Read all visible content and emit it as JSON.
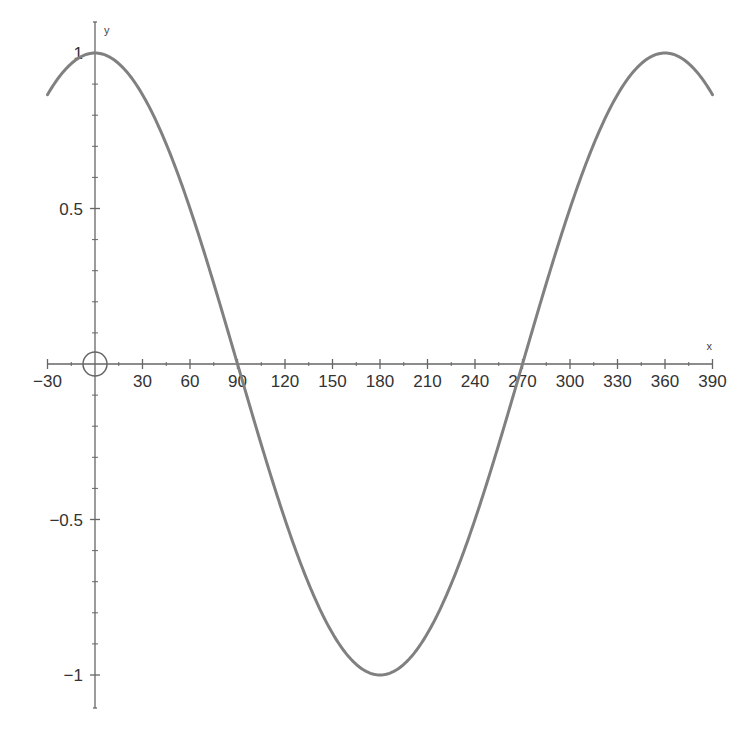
{
  "chart_data": {
    "type": "line",
    "title": "",
    "xlabel": "x",
    "ylabel": "y",
    "xlim": [
      -30,
      390
    ],
    "ylim": [
      -1,
      1
    ],
    "grid": false,
    "legend": null,
    "x_ticks": [
      -30,
      30,
      60,
      90,
      120,
      150,
      180,
      210,
      240,
      270,
      300,
      330,
      360,
      390
    ],
    "x_tick_labels": [
      "−30",
      "30",
      "60",
      "90",
      "120",
      "150",
      "180",
      "210",
      "240",
      "270",
      "300",
      "330",
      "360",
      "390"
    ],
    "y_ticks": [
      1,
      0.5,
      -0.5,
      -1
    ],
    "y_tick_labels": [
      "1",
      "0.5",
      "−0.5",
      "−1"
    ],
    "annotations": [
      "origin circle marker at (0, 0)"
    ],
    "series": [
      {
        "name": "y = cos x",
        "function": "cos(x degrees)",
        "color": "#808080",
        "x": [
          -30,
          0,
          30,
          60,
          90,
          120,
          150,
          180,
          210,
          240,
          270,
          300,
          330,
          360,
          390
        ],
        "values": [
          0.866,
          1,
          0.866,
          0.5,
          0,
          -0.5,
          -0.866,
          -1,
          -0.866,
          -0.5,
          0,
          0.5,
          0.866,
          1,
          0.866
        ]
      }
    ]
  },
  "colors": {
    "axis": "#666666",
    "curve": "#808080",
    "text": "#333333"
  }
}
